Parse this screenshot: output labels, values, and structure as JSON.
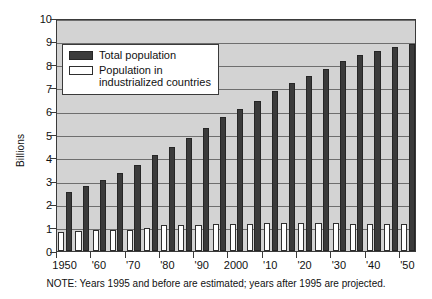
{
  "chart_data": {
    "type": "bar",
    "title": "",
    "xlabel": "",
    "ylabel": "Billions",
    "ylim": [
      0,
      10
    ],
    "yticks": [
      0,
      1,
      2,
      3,
      4,
      5,
      6,
      7,
      8,
      9,
      10
    ],
    "ytick_labels": [
      "0",
      "1",
      "2",
      "3",
      "4",
      "5",
      "6",
      "7",
      "8",
      "9",
      "10"
    ],
    "grid": true,
    "legend_position": "upper left",
    "x": [
      1950,
      1955,
      1960,
      1965,
      1970,
      1975,
      1980,
      1985,
      1990,
      1995,
      2000,
      2005,
      2010,
      2015,
      2020,
      2025,
      2030,
      2035,
      2040,
      2045,
      2050
    ],
    "xtick_labels": [
      "1950",
      "'60",
      "'70",
      "'80",
      "'90",
      "2000",
      "'10",
      "'20",
      "'30",
      "'40",
      "'50"
    ],
    "xtick_values": [
      1950,
      1960,
      1970,
      1980,
      1990,
      2000,
      2010,
      2020,
      2030,
      2040,
      2050
    ],
    "categories": [
      "1950",
      "1955",
      "1960",
      "1965",
      "1970",
      "1975",
      "1980",
      "1985",
      "1990",
      "1995",
      "2000",
      "2005",
      "2010",
      "2015",
      "2020",
      "2025",
      "2030",
      "2035",
      "2040",
      "2045",
      "2050"
    ],
    "series": [
      {
        "name": "Total population",
        "color": "#3b3b3b",
        "values": [
          2.55,
          2.8,
          3.05,
          3.35,
          3.7,
          4.1,
          4.45,
          4.85,
          5.3,
          5.75,
          6.1,
          6.45,
          6.85,
          7.2,
          7.5,
          7.8,
          8.15,
          8.4,
          8.6,
          8.75,
          8.9
        ]
      },
      {
        "name": "Population in industrialized countries",
        "color": "#ffffff",
        "values": [
          0.83,
          0.86,
          0.9,
          0.92,
          0.92,
          1.0,
          1.13,
          1.1,
          1.1,
          1.17,
          1.18,
          1.18,
          1.2,
          1.21,
          1.2,
          1.21,
          1.21,
          1.18,
          1.15,
          1.15,
          1.15
        ]
      }
    ],
    "note": "NOTE: Years 1995 and before are estimated; years after 1995 are projected."
  },
  "legend": {
    "items": [
      {
        "label_line1": "Total population",
        "label_line2": "",
        "swatch": "total"
      },
      {
        "label_line1": "Population in",
        "label_line2": "industrialized countries",
        "swatch": "indus"
      }
    ]
  },
  "colors": {
    "plot_background": "#d3d3d3",
    "grid": "#6e6e6e",
    "axis": "#3a3a3a",
    "total_bar": "#3b3b3b",
    "indus_bar": "#ffffff",
    "page_background": "#ffffff"
  }
}
